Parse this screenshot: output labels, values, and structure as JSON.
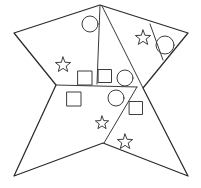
{
  "figure": {
    "canvas": {
      "width": 201,
      "height": 188,
      "background": "#ffffff"
    },
    "stroke_color": "#2b2b2b",
    "divider_color": "#3a3a3a",
    "glyph_color": "#3d3d3d",
    "outline": {
      "name": "concave-star-polygon",
      "points": "100,5 14,33 56,85 14,176 103,143 188,176 143,88 188,33",
      "vertex_list": [
        {
          "label": "top-apex",
          "x": 100,
          "y": 5
        },
        {
          "label": "left-upper-point",
          "x": 14,
          "y": 33
        },
        {
          "label": "left-notch",
          "x": 56,
          "y": 85
        },
        {
          "label": "bottom-left-point",
          "x": 14,
          "y": 176
        },
        {
          "label": "bottom-notch",
          "x": 103,
          "y": 143
        },
        {
          "label": "bottom-right-point",
          "x": 188,
          "y": 176
        },
        {
          "label": "right-notch",
          "x": 143,
          "y": 88
        },
        {
          "label": "right-upper-point",
          "x": 188,
          "y": 33
        }
      ]
    },
    "dividers": [
      {
        "name": "divider-apex-to-midline",
        "x1": 100,
        "y1": 6,
        "x2": 97,
        "y2": 84
      },
      {
        "name": "divider-horizontal-midline",
        "x1": 56,
        "y1": 85,
        "x2": 137,
        "y2": 87
      },
      {
        "name": "divider-apex-diagonal-right",
        "x1": 102,
        "y1": 6,
        "x2": 143,
        "y2": 88
      },
      {
        "name": "divider-lower-diagonal",
        "x1": 137,
        "y1": 87,
        "x2": 104,
        "y2": 143
      },
      {
        "name": "divider-right-edge-inner",
        "x1": 150,
        "y1": 24,
        "x2": 163,
        "y2": 60
      }
    ],
    "glyphs": [
      {
        "name": "circle-top-left-region",
        "type": "circle",
        "cx": 90,
        "cy": 24,
        "r": 8
      },
      {
        "name": "star-left-region",
        "type": "star",
        "cx": 63,
        "cy": 65,
        "r": 8
      },
      {
        "name": "square-left-of-centerline",
        "type": "square",
        "cx": 85,
        "cy": 78,
        "size": 14
      },
      {
        "name": "square-right-of-centerline",
        "type": "square",
        "cx": 105,
        "cy": 76,
        "size": 13
      },
      {
        "name": "circle-centre-upper",
        "type": "circle",
        "cx": 125,
        "cy": 78,
        "r": 8
      },
      {
        "name": "star-upper-right-region",
        "type": "star",
        "cx": 143,
        "cy": 38,
        "r": 8
      },
      {
        "name": "circle-upper-right-region",
        "type": "circle",
        "cx": 165,
        "cy": 45,
        "r": 9
      },
      {
        "name": "square-lower-left-region",
        "type": "square",
        "cx": 74,
        "cy": 99,
        "size": 14
      },
      {
        "name": "circle-centre-lower",
        "type": "circle",
        "cx": 116,
        "cy": 98,
        "r": 8
      },
      {
        "name": "square-lower-right-region",
        "type": "square",
        "cx": 136,
        "cy": 108,
        "size": 13
      },
      {
        "name": "star-lower-centre",
        "type": "star",
        "cx": 102,
        "cy": 123,
        "r": 7
      },
      {
        "name": "star-bottom-right",
        "type": "star",
        "cx": 125,
        "cy": 142,
        "r": 8
      }
    ],
    "counts": {
      "circles": 4,
      "squares": 4,
      "stars": 4,
      "regions": 6
    }
  }
}
